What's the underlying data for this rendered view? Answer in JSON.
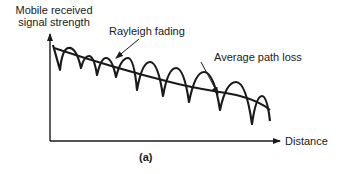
{
  "diagram": {
    "y_axis_label_line1": "Mobile received",
    "y_axis_label_line2": "signal strength",
    "x_axis_label": "Distance",
    "annotation_rayleigh": "Rayleigh fading",
    "annotation_average": "Average path loss",
    "caption": "(a)",
    "colors": {
      "ink": "#1a1a1a",
      "background": "#ffffff"
    }
  }
}
